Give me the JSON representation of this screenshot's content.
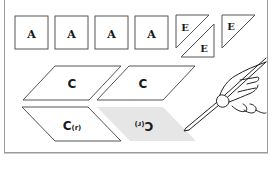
{
  "diagram": {
    "type": "quilt-pattern-pieces",
    "colors": {
      "outline": "#555555",
      "frame": "#9a9a9a",
      "shaded_piece": "#e6e6e6",
      "label": "#1a1a1a"
    },
    "pieces": {
      "squares": [
        {
          "label": "A"
        },
        {
          "label": "A"
        },
        {
          "label": "A"
        },
        {
          "label": "A"
        }
      ],
      "triangles": [
        {
          "label": "E"
        },
        {
          "label": "E"
        },
        {
          "label": "E"
        }
      ],
      "parallelograms": [
        {
          "label": "C",
          "variant": "normal"
        },
        {
          "label": "C",
          "variant": "normal"
        },
        {
          "label": "C",
          "suffix": "(r)",
          "variant": "reversed"
        },
        {
          "label": "C",
          "suffix": "(r)",
          "variant": "mirrored-shaded"
        }
      ]
    },
    "illustration": "hand-holding-pencil"
  }
}
